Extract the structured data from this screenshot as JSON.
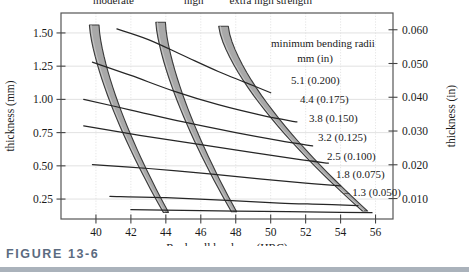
{
  "figure": {
    "caption": "FIGURE 13-6",
    "accent_color": "#5b6b80",
    "rule_color": "#aab2bb"
  },
  "chart_data": {
    "type": "line",
    "title": "",
    "xlabel": "Rockwell hardness (HRC)",
    "ylabel": "thickness (mm)",
    "ylabel_right": "thickness (in)",
    "xlim": [
      38,
      57
    ],
    "ylim": [
      0.1,
      1.65
    ],
    "ylim_right": [
      0.004,
      0.065
    ],
    "grid": true,
    "legend_position": "inside-right",
    "xticks": [
      40,
      42,
      44,
      46,
      48,
      50,
      52,
      54,
      56
    ],
    "xtick_labels": [
      "40",
      "42",
      "44",
      "46",
      "48",
      "50",
      "52",
      "54",
      "56"
    ],
    "yticks": [
      0.25,
      0.5,
      0.75,
      1.0,
      1.25,
      1.5
    ],
    "ytick_labels": [
      "0.25",
      "0.50",
      "0.75",
      "1.00",
      "1.25",
      "1.50"
    ],
    "yticks_right": [
      0.01,
      0.02,
      0.03,
      0.04,
      0.05,
      0.06
    ],
    "ytick_labels_right": [
      "0.010",
      "0.020",
      "0.030",
      "0.040",
      "0.050",
      "0.060"
    ],
    "annotation_title": "minimum bending radii",
    "annotation_subtitle": "mm   (in)",
    "series": [
      {
        "name": "5.1 (0.200)",
        "label": "5.1 (0.200)",
        "radius_mm": 5.1,
        "radius_in": 0.2,
        "x": [
          41.2,
          43.0,
          45.0,
          47.0,
          48.5,
          50.0
        ],
        "y": [
          1.53,
          1.45,
          1.33,
          1.21,
          1.13,
          1.05
        ]
      },
      {
        "name": "4.4 (0.175)",
        "label": "4.4 (0.175)",
        "radius_mm": 4.4,
        "radius_in": 0.175,
        "x": [
          39.8,
          42.0,
          44.5,
          47.0,
          49.5,
          51.5
        ],
        "y": [
          1.28,
          1.18,
          1.06,
          0.96,
          0.88,
          0.83
        ]
      },
      {
        "name": "3.8 (0.150)",
        "label": "3.8 (0.150)",
        "radius_mm": 3.8,
        "radius_in": 0.15,
        "x": [
          39.3,
          42.0,
          45.0,
          48.0,
          50.5,
          52.4
        ],
        "y": [
          1.0,
          0.92,
          0.83,
          0.75,
          0.69,
          0.65
        ]
      },
      {
        "name": "3.2 (0.125)",
        "label": "3.2 (0.125)",
        "radius_mm": 3.2,
        "radius_in": 0.125,
        "x": [
          39.3,
          42.5,
          46.0,
          49.0,
          51.5,
          53.3
        ],
        "y": [
          0.8,
          0.73,
          0.66,
          0.6,
          0.55,
          0.52
        ]
      },
      {
        "name": "2.5 (0.100)",
        "label": "2.5 (0.100)",
        "radius_mm": 2.5,
        "radius_in": 0.1,
        "x": [
          39.8,
          43.0,
          46.5,
          49.5,
          52.0,
          54.0
        ],
        "y": [
          0.51,
          0.48,
          0.44,
          0.4,
          0.37,
          0.35
        ]
      },
      {
        "name": "1.8 (0.075)",
        "label": "1.8 (0.075)",
        "radius_mm": 1.8,
        "radius_in": 0.075,
        "x": [
          40.8,
          44.0,
          47.5,
          50.5,
          53.0,
          55.0
        ],
        "y": [
          0.27,
          0.26,
          0.24,
          0.22,
          0.21,
          0.2
        ]
      },
      {
        "name": "1.3 (0.050)",
        "label": "1.3 (0.050)",
        "radius_mm": 1.3,
        "radius_in": 0.05,
        "x": [
          42.0,
          45.0,
          48.0,
          51.0,
          54.0,
          55.8
        ],
        "y": [
          0.17,
          0.165,
          0.16,
          0.155,
          0.15,
          0.148
        ]
      }
    ],
    "bands": [
      {
        "name": "moderate",
        "label": "moderate",
        "fill": "#a8a8a8",
        "stroke": "#3a3a3a",
        "x_top": 39.9,
        "x_bottom": 44.0,
        "y_top": 1.56,
        "y_bottom": 0.15,
        "width_top": 0.55,
        "width_bottom": 0.3
      },
      {
        "name": "high",
        "label": "high",
        "fill": "#a8a8a8",
        "stroke": "#3a3a3a",
        "x_top": 43.7,
        "x_bottom": 47.9,
        "y_top": 1.58,
        "y_bottom": 0.155,
        "width_top": 0.55,
        "width_bottom": 0.3
      },
      {
        "name": "extra high strength",
        "label": "extra high strength",
        "fill": "#a8a8a8",
        "stroke": "#3a3a3a",
        "x_top": 47.3,
        "x_bottom": 55.4,
        "y_top": 1.55,
        "y_bottom": 0.16,
        "width_top": 0.55,
        "width_bottom": 0.3
      }
    ],
    "band_labels": [
      {
        "text": "moderate",
        "x": 41.0,
        "y": 1.72
      },
      {
        "text": "high",
        "x": 45.6,
        "y": 1.72
      },
      {
        "text": "extra high strength",
        "x": 50.0,
        "y": 1.72
      }
    ]
  }
}
